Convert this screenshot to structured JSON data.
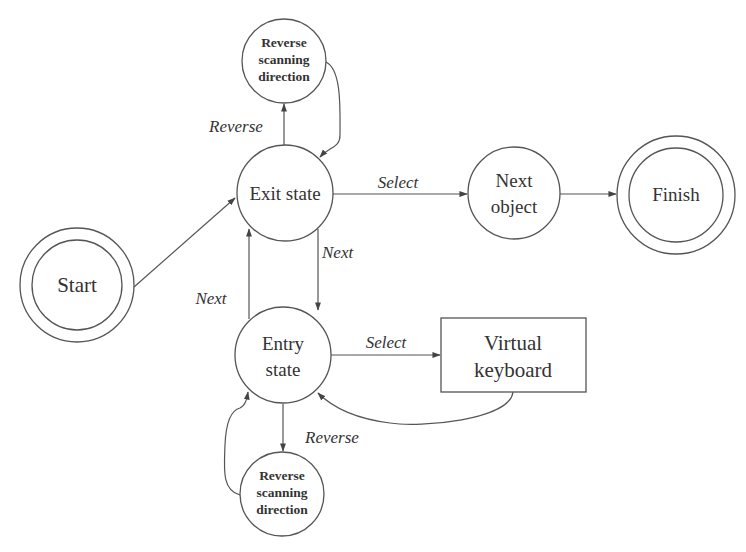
{
  "diagram": {
    "type": "state-transition",
    "nodes": {
      "start": {
        "label": "Start",
        "shape": "double-circle"
      },
      "exit_state": {
        "label": "Exit state",
        "shape": "circle"
      },
      "next_object": {
        "line1": "Next",
        "line2": "object",
        "shape": "circle"
      },
      "finish": {
        "label": "Finish",
        "shape": "double-circle"
      },
      "entry_state": {
        "line1": "Entry",
        "line2": "state",
        "shape": "circle"
      },
      "virtual_keyboard": {
        "line1": "Virtual",
        "line2": "keyboard",
        "shape": "rectangle"
      },
      "reverse_top": {
        "line1": "Reverse",
        "line2": "scanning",
        "line3": "direction",
        "shape": "circle"
      },
      "reverse_bottom": {
        "line1": "Reverse",
        "line2": "scanning",
        "line3": "direction",
        "shape": "circle"
      }
    },
    "edges": {
      "start_to_exit": {
        "from": "Start",
        "to": "Exit state",
        "label": ""
      },
      "exit_select": {
        "from": "Exit state",
        "to": "Next object",
        "label": "Select"
      },
      "next_to_finish": {
        "from": "Next object",
        "to": "Finish",
        "label": ""
      },
      "exit_reverse": {
        "from": "Exit state",
        "to": "Reverse scanning direction",
        "label": "Reverse"
      },
      "reverse_top_back": {
        "from": "Reverse scanning direction",
        "to": "Exit state",
        "label": ""
      },
      "exit_next": {
        "from": "Exit state",
        "to": "Entry state",
        "label": "Next"
      },
      "entry_next": {
        "from": "Entry state",
        "to": "Exit state",
        "label": "Next"
      },
      "entry_select": {
        "from": "Entry state",
        "to": "Virtual keyboard",
        "label": "Select"
      },
      "keyboard_back": {
        "from": "Virtual keyboard",
        "to": "Entry state",
        "label": ""
      },
      "entry_reverse": {
        "from": "Entry state",
        "to": "Reverse scanning direction",
        "label": "Reverse"
      },
      "reverse_bottom_back": {
        "from": "Reverse scanning direction",
        "to": "Entry state",
        "label": ""
      }
    }
  },
  "colors": {
    "line": "#555555",
    "text": "#333333",
    "background": "#ffffff"
  }
}
